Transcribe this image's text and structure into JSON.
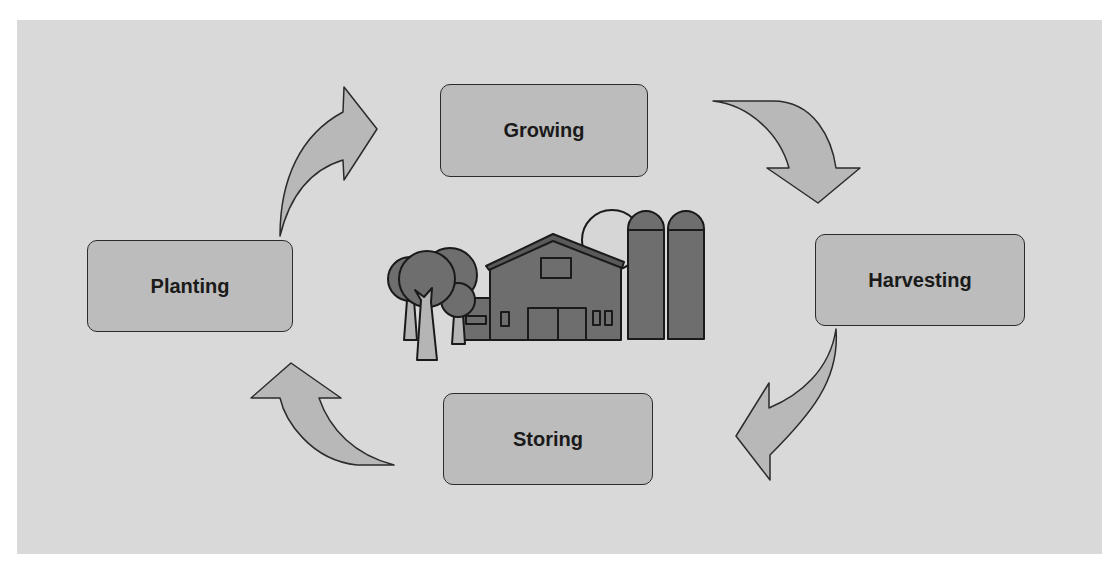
{
  "diagram": {
    "type": "cycle",
    "title": "",
    "stages": [
      {
        "id": "growing",
        "label": "Growing"
      },
      {
        "id": "harvesting",
        "label": "Harvesting"
      },
      {
        "id": "storing",
        "label": "Storing"
      },
      {
        "id": "planting",
        "label": "Planting"
      }
    ],
    "flow": [
      {
        "from": "Planting",
        "to": "Growing"
      },
      {
        "from": "Growing",
        "to": "Harvesting"
      },
      {
        "from": "Harvesting",
        "to": "Storing"
      },
      {
        "from": "Storing",
        "to": "Planting"
      }
    ],
    "center_illustration": "farm-icon (barn, trees, silos, sun)"
  },
  "colors": {
    "background": "#d9d9d9",
    "box_fill": "#bcbcbc",
    "arrow_fill": "#b8b8b8",
    "outline": "#2b2b2b",
    "barn_fill": "#6e6e6e",
    "sun_fill": "#d6d6d6"
  }
}
